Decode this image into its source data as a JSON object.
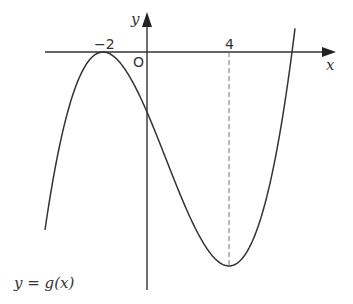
{
  "chart_data": {
    "type": "line",
    "title": "",
    "xlabel": "x",
    "ylabel": "y",
    "origin_label": "O",
    "tick_labels": [
      "−2",
      "4"
    ],
    "x_marks": [
      -2,
      4
    ],
    "curve_label": "y = g(x)",
    "series": [
      {
        "name": "y = g(x)",
        "description": "cubic with double root at x = -2 (local maximum touching x-axis), local minimum at x = 4, crossing x-axis again near x = 7",
        "key_points": [
          {
            "x": -2,
            "y": 0,
            "note": "local maximum on x-axis"
          },
          {
            "x": 4,
            "y": "min",
            "note": "local minimum, dashed vertical line to x-axis"
          }
        ]
      }
    ],
    "grid": false,
    "legend": "none"
  },
  "labels": {
    "x_axis": "x",
    "y_axis": "y",
    "origin": "O",
    "tick_neg2": "−2",
    "tick_4": "4",
    "curve_y": "y",
    "curve_eq": " = g(x)"
  }
}
